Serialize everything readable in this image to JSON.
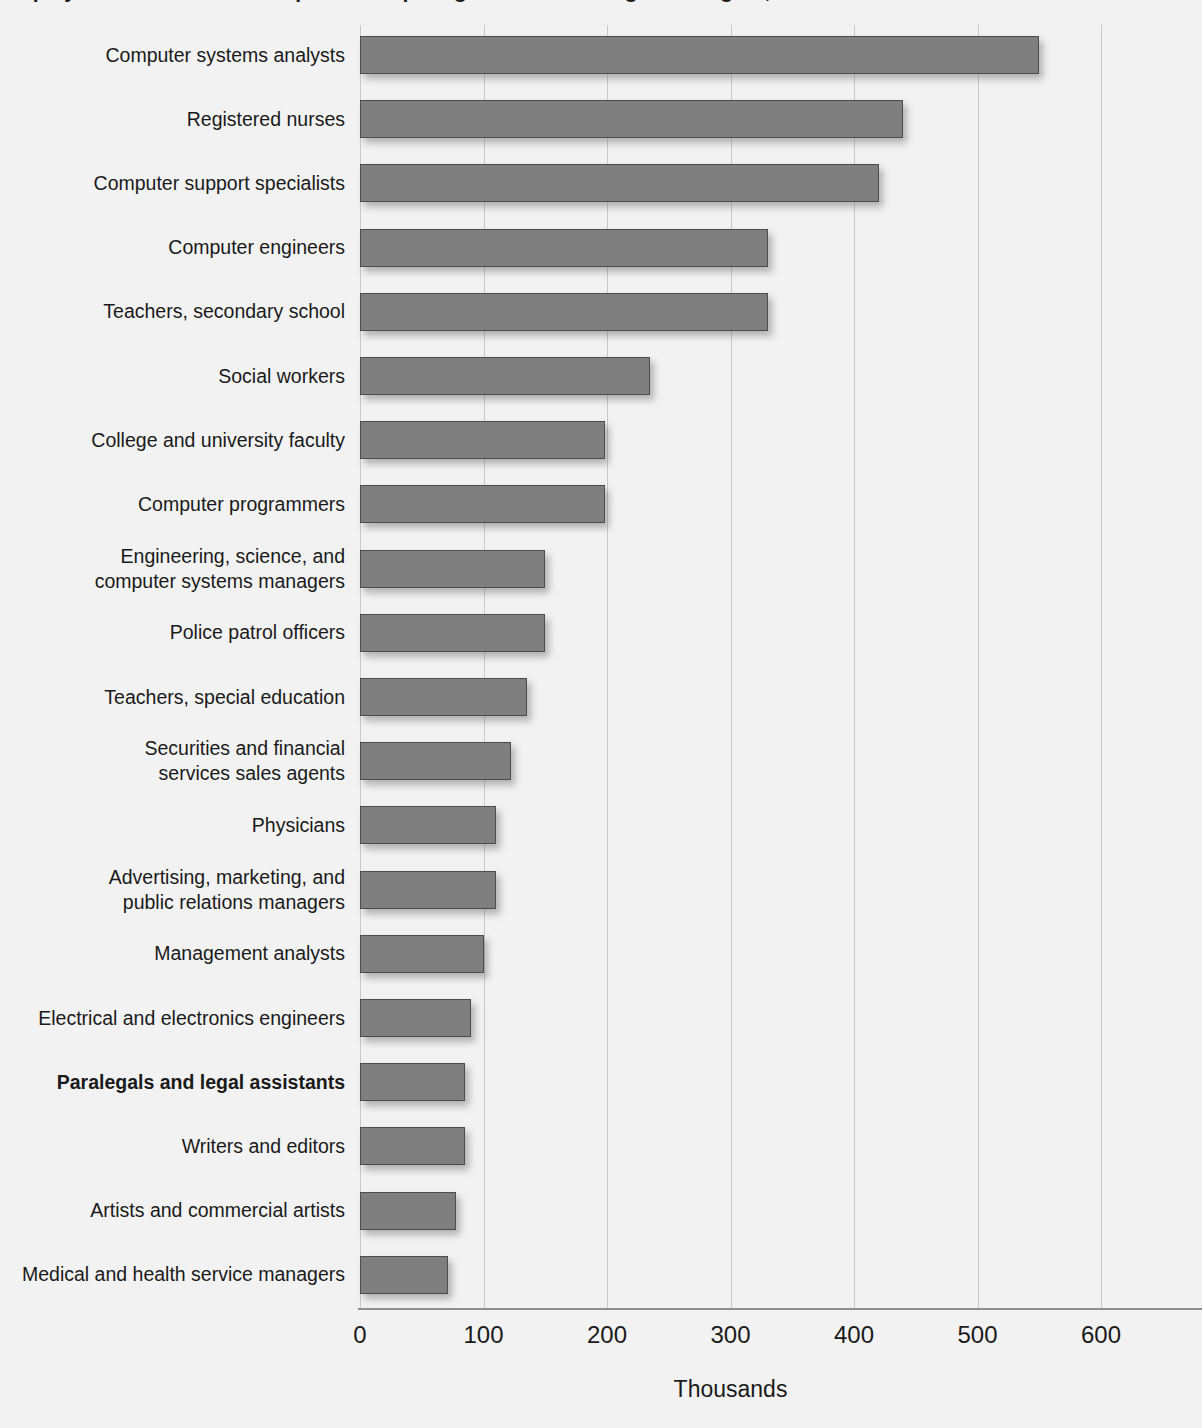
{
  "title": "Employment in selected occupations requiring a bachelor's degree or higher, 1998",
  "axis": {
    "x_title": "Thousands",
    "ticks": [
      0,
      100,
      200,
      300,
      400,
      500,
      600
    ],
    "tick_labels": [
      "0",
      "100",
      "200",
      "300",
      "400",
      "500",
      "600"
    ]
  },
  "colors": {
    "bar_fill": "#7f7f7f",
    "bar_border": "#4d4d4d",
    "gridline": "#c9c9c9",
    "background": "#f2f2f2",
    "text": "#1a1a1a"
  },
  "chart_data": {
    "type": "bar",
    "orientation": "horizontal",
    "title": "Employment in selected occupations requiring a bachelor's degree or higher, 1998",
    "xlabel": "Thousands",
    "ylabel": "",
    "xlim": [
      0,
      620
    ],
    "grid": true,
    "legend": "none",
    "highlighted_category": "Paralegals and legal assistants",
    "categories": [
      "Computer systems analysts",
      "Registered nurses",
      "Computer support specialists",
      "Computer engineers",
      "Teachers, secondary school",
      "Social workers",
      "College and university faculty",
      "Computer programmers",
      "Engineering, science, and computer systems managers",
      "Police patrol officers",
      "Teachers, special education",
      "Securities and financial services sales agents",
      "Physicians",
      "Advertising, marketing, and public relations managers",
      "Management analysts",
      "Electrical and electronics engineers",
      "Paralegals and legal assistants",
      "Writers and editors",
      "Artists and commercial artists",
      "Medical and health service managers"
    ],
    "category_lines": [
      [
        "Computer systems analysts"
      ],
      [
        "Registered nurses"
      ],
      [
        "Computer support specialists"
      ],
      [
        "Computer engineers"
      ],
      [
        "Teachers, secondary school"
      ],
      [
        "Social workers"
      ],
      [
        "College and university faculty"
      ],
      [
        "Computer programmers"
      ],
      [
        "Engineering, science, and",
        "computer systems managers"
      ],
      [
        "Police patrol officers"
      ],
      [
        "Teachers, special education"
      ],
      [
        "Securities and financial",
        "services sales agents"
      ],
      [
        "Physicians"
      ],
      [
        "Advertising, marketing, and",
        "public relations managers"
      ],
      [
        "Management analysts"
      ],
      [
        "Electrical and electronics engineers"
      ],
      [
        "Paralegals and legal assistants"
      ],
      [
        "Writers and editors"
      ],
      [
        "Artists and commercial artists"
      ],
      [
        "Medical and health service managers"
      ]
    ],
    "values": [
      550,
      440,
      420,
      330,
      330,
      235,
      198,
      198,
      150,
      150,
      135,
      122,
      110,
      110,
      100,
      90,
      85,
      85,
      78,
      71
    ],
    "bold_flags": [
      false,
      false,
      false,
      false,
      false,
      false,
      false,
      false,
      false,
      false,
      false,
      false,
      false,
      false,
      false,
      false,
      true,
      false,
      false,
      false
    ]
  }
}
